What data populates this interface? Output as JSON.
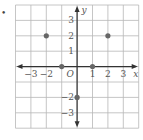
{
  "bullet": "•",
  "chart_data": {
    "type": "scatter",
    "title": "",
    "xlabel": "x",
    "ylabel": "y",
    "origin_label": "O",
    "xlim": [
      -4,
      4
    ],
    "ylim": [
      -4,
      4
    ],
    "grid": true,
    "x_ticks": [
      "-3",
      "-2",
      "1",
      "2",
      "3"
    ],
    "y_ticks": [
      "3",
      "2",
      "1",
      "-2",
      "-3"
    ],
    "points": [
      {
        "x": -2,
        "y": 2
      },
      {
        "x": 2,
        "y": 2
      },
      {
        "x": -1,
        "y": 0
      },
      {
        "x": 1,
        "y": 0
      },
      {
        "x": 0,
        "y": -2
      }
    ],
    "colors": {
      "grid": "#b8b8b8",
      "axis": "#333333",
      "point": "#666666",
      "label": "#555555"
    }
  }
}
